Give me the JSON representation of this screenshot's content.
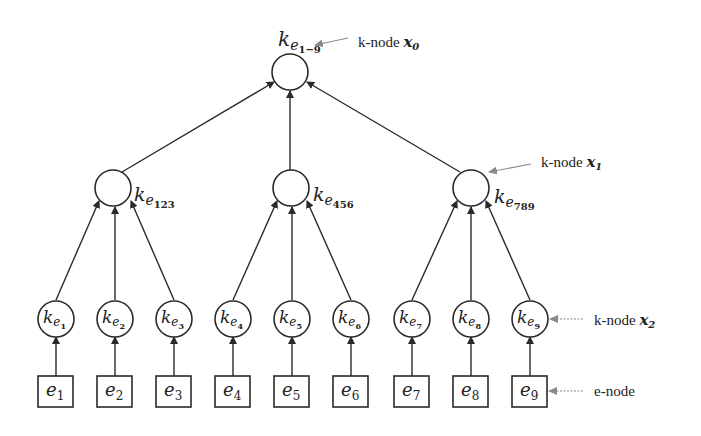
{
  "diagram": {
    "title": "",
    "colors": {
      "stroke": "#2a2a2a",
      "annotation": "#8a8a8a",
      "background": "#ffffff"
    },
    "root": {
      "id": "k-root",
      "base": "k",
      "sub": "e",
      "subsub": "1−9"
    },
    "mid_nodes": [
      {
        "id": "k-123",
        "base": "k",
        "sub": "e",
        "subsub": "123"
      },
      {
        "id": "k-456",
        "base": "k",
        "sub": "e",
        "subsub": "456"
      },
      {
        "id": "k-789",
        "base": "k",
        "sub": "e",
        "subsub": "789"
      }
    ],
    "leaf_knodes": [
      {
        "id": "k-1",
        "base": "k",
        "sub": "e",
        "subsub": "1"
      },
      {
        "id": "k-2",
        "base": "k",
        "sub": "e",
        "subsub": "2"
      },
      {
        "id": "k-3",
        "base": "k",
        "sub": "e",
        "subsub": "3"
      },
      {
        "id": "k-4",
        "base": "k",
        "sub": "e",
        "subsub": "4"
      },
      {
        "id": "k-5",
        "base": "k",
        "sub": "e",
        "subsub": "5"
      },
      {
        "id": "k-6",
        "base": "k",
        "sub": "e",
        "subsub": "6"
      },
      {
        "id": "k-7",
        "base": "k",
        "sub": "e",
        "subsub": "7"
      },
      {
        "id": "k-8",
        "base": "k",
        "sub": "e",
        "subsub": "8"
      },
      {
        "id": "k-9",
        "base": "k",
        "sub": "e",
        "subsub": "9"
      }
    ],
    "enodes": [
      {
        "id": "e-1",
        "base": "e",
        "sub": "1"
      },
      {
        "id": "e-2",
        "base": "e",
        "sub": "2"
      },
      {
        "id": "e-3",
        "base": "e",
        "sub": "3"
      },
      {
        "id": "e-4",
        "base": "e",
        "sub": "4"
      },
      {
        "id": "e-5",
        "base": "e",
        "sub": "5"
      },
      {
        "id": "e-6",
        "base": "e",
        "sub": "6"
      },
      {
        "id": "e-7",
        "base": "e",
        "sub": "7"
      },
      {
        "id": "e-8",
        "base": "e",
        "sub": "8"
      },
      {
        "id": "e-9",
        "base": "e",
        "sub": "9"
      }
    ],
    "annotations": [
      {
        "label": "k-node ",
        "var": "x",
        "sub": "0",
        "target": "root"
      },
      {
        "label": "k-node ",
        "var": "x",
        "sub": "1",
        "target": "k-789"
      },
      {
        "label": "k-node ",
        "var": "x",
        "sub": "2",
        "target": "k-9"
      },
      {
        "label": "e-node",
        "var": "",
        "sub": "",
        "target": "e-9"
      }
    ]
  }
}
